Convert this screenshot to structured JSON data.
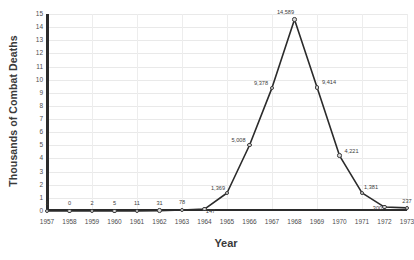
{
  "chart_data": {
    "type": "line",
    "title": "",
    "xlabel": "Year",
    "ylabel": "Thousands of Combat Deaths",
    "categories": [
      "1957",
      "1958",
      "1959",
      "1960",
      "1961",
      "1962",
      "1963",
      "1964",
      "1965",
      "1966",
      "1967",
      "1968",
      "1969",
      "1970",
      "1971",
      "1972",
      "1973"
    ],
    "x": [
      1957,
      1958,
      1959,
      1960,
      1961,
      1962,
      1963,
      1964,
      1965,
      1966,
      1967,
      1968,
      1969,
      1970,
      1971,
      1972,
      1973
    ],
    "values": [
      1,
      0,
      2,
      5,
      11,
      31,
      78,
      147,
      1369,
      5008,
      9378,
      14589,
      9414,
      4221,
      1381,
      300,
      237
    ],
    "point_labels": [
      "1",
      "0",
      "2",
      "5",
      "11",
      "31",
      "78",
      "147",
      "1,369",
      "5,008",
      "9,378",
      "14,589",
      "9,414",
      "4,221",
      "1,381",
      "300",
      "237"
    ],
    "ylim": [
      0,
      15
    ],
    "y_unit_scale": 1000,
    "yticks": [
      0,
      1,
      2,
      3,
      4,
      5,
      6,
      7,
      8,
      9,
      10,
      11,
      12,
      13,
      14,
      15
    ],
    "ytick_labels": [
      "0",
      "1",
      "2",
      "3",
      "4",
      "5",
      "6",
      "7",
      "8",
      "9",
      "10",
      "11",
      "12",
      "13",
      "14",
      "15"
    ],
    "grid": true,
    "grid_color": "#e9e9e9",
    "legend": false,
    "legend_position": "none",
    "line_color": "#2b2b2b",
    "marker_face_color": "#d8d8d8",
    "marker_edge_color": "#3a3a3a",
    "axis_color": "#2b2b2b",
    "text_color": "#3a3a3a",
    "background": "#ffffff"
  }
}
